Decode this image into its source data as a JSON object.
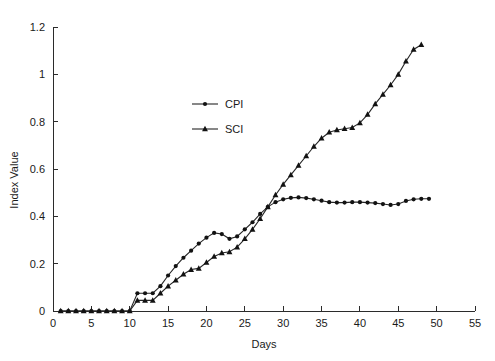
{
  "chart_data": {
    "type": "line",
    "title": "",
    "subtitle": "",
    "xlabel": "Days",
    "ylabel": "Index Value",
    "xlim": [
      0,
      55
    ],
    "ylim": [
      0,
      1.2
    ],
    "xticks": [
      0,
      5,
      10,
      15,
      20,
      25,
      30,
      35,
      40,
      45,
      50,
      55
    ],
    "xtick_labels": [
      "0",
      "5",
      "10",
      "15",
      "20",
      "25",
      "30",
      "35",
      "40",
      "45",
      "50",
      "55"
    ],
    "yticks": [
      0,
      0.2,
      0.4,
      0.6,
      0.8,
      1,
      1.2
    ],
    "ytick_labels": [
      "0",
      "0.2",
      "0.4",
      "0.6",
      "0.8",
      "1",
      "1.2"
    ],
    "grid": false,
    "legend_position": "upper-center",
    "line_color": "#262626",
    "marker_color": "#121212",
    "background_color": "#ffffff",
    "series": [
      {
        "name": "CPI",
        "marker": "circle",
        "x": [
          1,
          2,
          3,
          4,
          5,
          6,
          7,
          8,
          9,
          10,
          11,
          12,
          13,
          14,
          15,
          16,
          17,
          18,
          19,
          20,
          21,
          22,
          23,
          24,
          25,
          26,
          27,
          28,
          29,
          30,
          31,
          32,
          33,
          34,
          35,
          36,
          37,
          38,
          39,
          40,
          41,
          42,
          43,
          44,
          45,
          46,
          47,
          48,
          49
        ],
        "values": [
          0,
          0,
          0,
          0,
          0,
          0,
          0,
          0,
          0,
          0,
          0.075,
          0.075,
          0.075,
          0.105,
          0.15,
          0.19,
          0.225,
          0.255,
          0.285,
          0.31,
          0.33,
          0.325,
          0.305,
          0.315,
          0.345,
          0.375,
          0.41,
          0.44,
          0.46,
          0.472,
          0.478,
          0.48,
          0.477,
          0.472,
          0.466,
          0.46,
          0.458,
          0.458,
          0.46,
          0.46,
          0.458,
          0.456,
          0.452,
          0.448,
          0.452,
          0.465,
          0.472,
          0.474,
          0.474
        ]
      },
      {
        "name": "SCI",
        "marker": "triangle",
        "x": [
          1,
          2,
          3,
          4,
          5,
          6,
          7,
          8,
          9,
          10,
          11,
          12,
          13,
          14,
          15,
          16,
          17,
          18,
          19,
          20,
          21,
          22,
          23,
          24,
          25,
          26,
          27,
          28,
          29,
          30,
          31,
          32,
          33,
          34,
          35,
          36,
          37,
          38,
          39,
          40,
          41,
          42,
          43,
          44,
          45,
          46,
          47,
          48
        ],
        "values": [
          0,
          0,
          0,
          0,
          0,
          0,
          0,
          0,
          0,
          0,
          0.045,
          0.045,
          0.045,
          0.075,
          0.105,
          0.13,
          0.155,
          0.175,
          0.18,
          0.205,
          0.23,
          0.245,
          0.25,
          0.27,
          0.305,
          0.345,
          0.39,
          0.44,
          0.49,
          0.535,
          0.575,
          0.615,
          0.655,
          0.695,
          0.73,
          0.755,
          0.765,
          0.77,
          0.775,
          0.795,
          0.83,
          0.875,
          0.915,
          0.955,
          1.0,
          1.055,
          1.105,
          1.125
        ]
      }
    ],
    "legend": [
      {
        "label": "CPI",
        "marker": "circle"
      },
      {
        "label": "SCI",
        "marker": "triangle"
      }
    ]
  }
}
